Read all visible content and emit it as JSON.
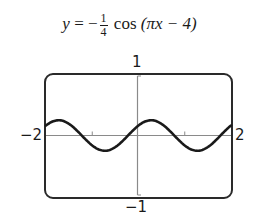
{
  "chart_data": {
    "type": "line",
    "title_parts": {
      "lhs": "y",
      "equals": "=",
      "sign": "−",
      "frac_num": "1",
      "frac_den": "4",
      "func": "cos",
      "arg": "(πx − 4)"
    },
    "xlabel": "",
    "ylabel": "",
    "xlim": [
      -2,
      2
    ],
    "ylim": [
      -1,
      1
    ],
    "x_ticks": [
      -1,
      1
    ],
    "y_ticks": [],
    "axis_labels": {
      "xmin": "−2",
      "xmax": "2",
      "ymax": "1",
      "ymin": "−1"
    },
    "grid": false,
    "series": [
      {
        "name": "y = -1/4 cos(πx - 4)",
        "amplitude": 0.25,
        "period": 2,
        "x": [
          -2,
          -1.73,
          -1.5,
          -1.23,
          -1,
          -0.73,
          -0.5,
          -0.23,
          0,
          0.27,
          0.5,
          0.77,
          1,
          1.27,
          1.5,
          1.77,
          2
        ],
        "values": [
          0.163,
          0.25,
          0.189,
          0.0,
          -0.163,
          -0.25,
          -0.189,
          0.0,
          0.163,
          0.25,
          0.189,
          0.0,
          -0.163,
          -0.25,
          -0.189,
          0.0,
          0.163
        ]
      }
    ],
    "colors": {
      "curve": "#1a1a1a",
      "frame": "#2a2a2a",
      "axes": "#8a8a8a"
    }
  }
}
